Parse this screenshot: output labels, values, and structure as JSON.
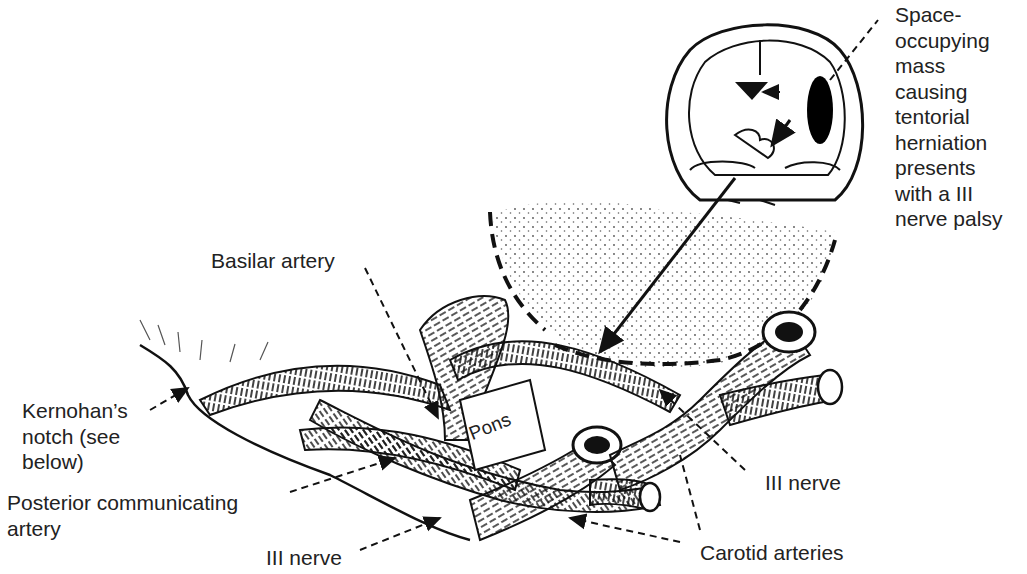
{
  "figure": {
    "colors": {
      "ink": "#111111",
      "background": "#ffffff",
      "label_text": "#222222"
    },
    "inset": {
      "description": "Coronal brain section with space-occupying mass",
      "mass_fill": "#000000"
    },
    "labels": {
      "mass_callout": "Space-\noccupying\nmass\ncausing\ntentorial\nherniation\npresents\nwith a III\nnerve palsy",
      "basilar_artery": "Basilar artery",
      "kernohans_notch": "Kernohan’s\nnotch (see\nbelow)",
      "posterior_communicating_artery": "Posterior communicating\nartery",
      "iii_nerve_left": "III nerve",
      "iii_nerve_right": "III nerve",
      "carotid_arteries": "Carotid arteries",
      "pons": "Pons"
    }
  }
}
